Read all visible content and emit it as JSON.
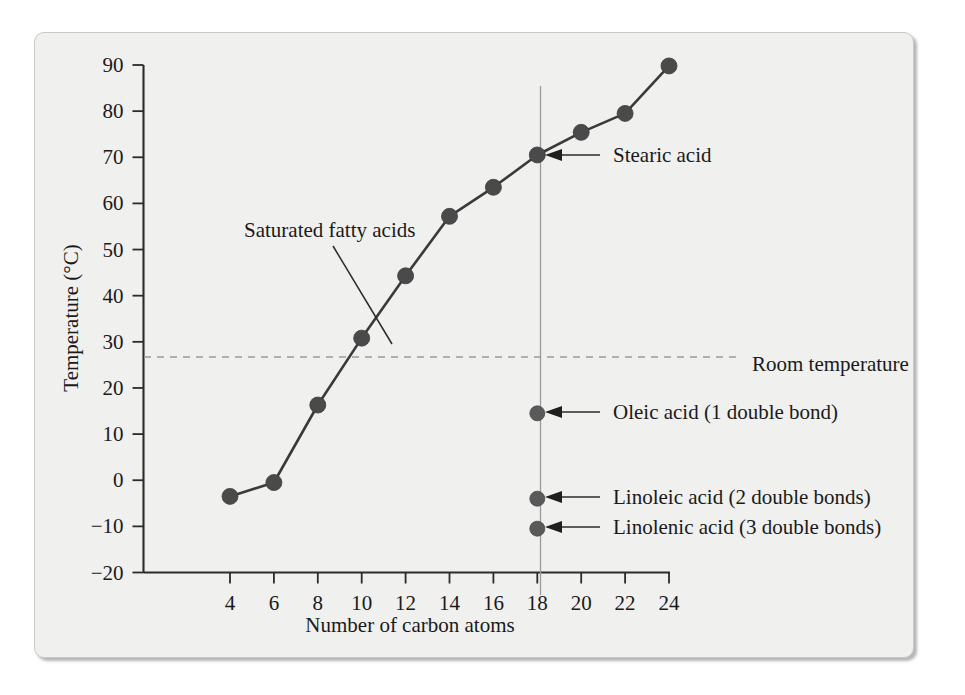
{
  "figure": {
    "caption_alt": "Melting points of fatty acids versus carbon chain length",
    "panel_background": "#f0f0ee",
    "ink_color": "#2b2b2b",
    "marker_color": "#4a4a4a",
    "guide_color": "#9a9a9a"
  },
  "chart_data": {
    "type": "line",
    "title": "",
    "xlabel": "Number of carbon atoms",
    "ylabel": "Temperature (°C)",
    "xlim": [
      2,
      25
    ],
    "ylim": [
      -20,
      90
    ],
    "xticks": [
      4,
      6,
      8,
      10,
      12,
      14,
      16,
      18,
      20,
      22,
      24
    ],
    "xtick_labels": [
      "4",
      "6",
      "8",
      "10",
      "12",
      "14",
      "16",
      "18",
      "20",
      "22",
      "24"
    ],
    "yticks": [
      -20,
      -10,
      0,
      10,
      20,
      30,
      40,
      50,
      60,
      70,
      80,
      90
    ],
    "ytick_labels": [
      "−20",
      "−10",
      "0",
      "10",
      "20",
      "30",
      "40",
      "50",
      "60",
      "70",
      "80",
      "90"
    ],
    "grid": false,
    "legend": false,
    "series": [
      {
        "name": "Saturated fatty acids",
        "marker": "filled-circle",
        "x": [
          4,
          6,
          8,
          10,
          12,
          14,
          16,
          18,
          20,
          22,
          24
        ],
        "y": [
          -3.5,
          -0.5,
          16.3,
          30.8,
          44.3,
          57.2,
          63.5,
          70.5,
          75.4,
          79.5,
          89.8
        ]
      },
      {
        "name": "Unsaturated fatty acids (18 carbons)",
        "marker": "filled-circle",
        "points": [
          {
            "label": "Oleic acid (1 double bond)",
            "x": 18,
            "y": 14.5
          },
          {
            "label": "Linoleic acid (2 double bonds)",
            "x": 18,
            "y": -4.0
          },
          {
            "label": "Linolenic acid (3 double bonds)",
            "x": 18,
            "y": -10.5
          }
        ]
      }
    ],
    "reference_lines": [
      {
        "name": "Room temperature",
        "orientation": "horizontal",
        "value": 25,
        "style": "dashed",
        "label": "Room temperature"
      },
      {
        "name": "18-carbon guide",
        "orientation": "vertical",
        "value": 18,
        "style": "solid",
        "label": ""
      }
    ],
    "annotations": [
      {
        "name": "saturated-fatty-acids",
        "text": "Saturated fatty acids",
        "points_to_x": 10,
        "points_to_y": 30.8,
        "arrow": false
      },
      {
        "name": "stearic-acid",
        "text": "Stearic acid",
        "points_to_x": 18,
        "points_to_y": 70.5,
        "arrow": true
      },
      {
        "name": "oleic-acid",
        "text": "Oleic acid (1 double bond)",
        "points_to_x": 18,
        "points_to_y": 14.5,
        "arrow": true
      },
      {
        "name": "linoleic-acid",
        "text": "Linoleic acid (2 double bonds)",
        "points_to_x": 18,
        "points_to_y": -4.0,
        "arrow": true
      },
      {
        "name": "linolenic-acid",
        "text": "Linolenic acid (3 double bonds)",
        "points_to_x": 18,
        "points_to_y": -10.5,
        "arrow": true
      }
    ]
  }
}
